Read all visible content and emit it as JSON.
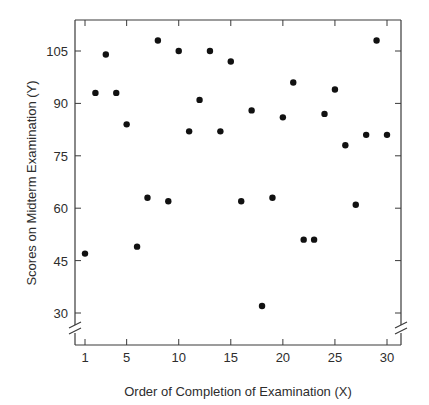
{
  "chart_data": {
    "type": "scatter",
    "title": "",
    "xlabel": "Order of Completion of Examination (X)",
    "ylabel": "Scores on Midterm Examination (Y)",
    "x_ticks": [
      1,
      5,
      10,
      15,
      20,
      25,
      30
    ],
    "y_ticks": [
      30,
      45,
      60,
      75,
      90,
      105
    ],
    "xlim": [
      0,
      31.5
    ],
    "ylim": [
      22,
      112
    ],
    "axis_breaks": {
      "x": true,
      "y": true
    },
    "grid": false,
    "legend": null,
    "point_color": "#111111",
    "x": [
      1,
      2,
      3,
      4,
      5,
      6,
      7,
      8,
      9,
      10,
      11,
      12,
      13,
      14,
      15,
      16,
      17,
      18,
      19,
      20,
      21,
      22,
      23,
      24,
      25,
      26,
      27,
      28,
      29,
      30
    ],
    "y": [
      47,
      93,
      104,
      93,
      84,
      49,
      63,
      108,
      62,
      105,
      82,
      91,
      105,
      82,
      102,
      62,
      88,
      32,
      63,
      86,
      96,
      51,
      51,
      87,
      94,
      78,
      61,
      81,
      108,
      81
    ]
  }
}
